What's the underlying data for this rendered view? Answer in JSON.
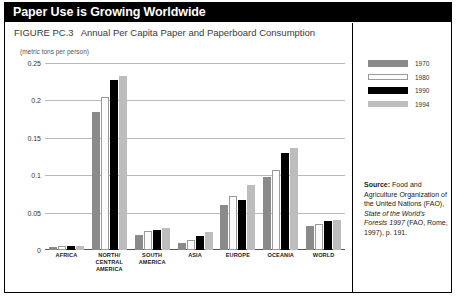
{
  "banner": {
    "title": "Paper Use is Growing Worldwide"
  },
  "figure": {
    "number": "FIGURE PC.3",
    "caption": "Annual Per Capita Paper and Paperboard Consumption"
  },
  "units_note": "(metric tons per person)",
  "legend": {
    "items": [
      {
        "label": "1970",
        "key": "y1970",
        "color": "#8a8a8a"
      },
      {
        "label": "1980",
        "key": "y1980",
        "color": "#fbfbfb"
      },
      {
        "label": "1990",
        "key": "y1990",
        "color": "#000000"
      },
      {
        "label": "1994",
        "key": "y1994",
        "color": "#bdbdbd"
      }
    ]
  },
  "source": {
    "label": "Source:",
    "text_1": " Food and Agriculture Organization of the United Nations (FAO), ",
    "italic": "State of the World's Forests 1997",
    "text_2": " (FAO, Rome, 1997), p. 191."
  },
  "chart_data": {
    "type": "bar",
    "title": "Annual Per Capita Paper and Paperboard Consumption",
    "xlabel": "",
    "ylabel": "(metric tons per person)",
    "ylim": [
      0,
      0.25
    ],
    "yticks": [
      "0",
      "0.05",
      "0.1",
      "0.15",
      "0.2",
      "0.25"
    ],
    "ytick_values": [
      0,
      0.05,
      0.1,
      0.15,
      0.2,
      0.25
    ],
    "grid": true,
    "legend_position": "top-right",
    "categories": [
      "AFRICA",
      "NORTH/ CENTRAL AMERICA",
      "SOUTH AMERICA",
      "ASIA",
      "EUROPE",
      "OCEANIA",
      "WORLD"
    ],
    "category_lines": [
      [
        "AFRICA",
        ""
      ],
      [
        "NORTH/",
        "CENTRAL AMERICA"
      ],
      [
        "SOUTH",
        "AMERICA"
      ],
      [
        "ASIA",
        ""
      ],
      [
        "EUROPE",
        ""
      ],
      [
        "OCEANIA",
        ""
      ],
      [
        "WORLD",
        ""
      ]
    ],
    "series": [
      {
        "name": "1970",
        "values": [
          0.004,
          0.185,
          0.02,
          0.01,
          0.06,
          0.097,
          0.032
        ]
      },
      {
        "name": "1980",
        "values": [
          0.005,
          0.205,
          0.026,
          0.014,
          0.072,
          0.107,
          0.035
        ]
      },
      {
        "name": "1990",
        "values": [
          0.006,
          0.227,
          0.027,
          0.019,
          0.067,
          0.13,
          0.039
        ]
      },
      {
        "name": "1994",
        "values": [
          0.005,
          0.232,
          0.03,
          0.024,
          0.087,
          0.136,
          0.04
        ]
      }
    ]
  }
}
